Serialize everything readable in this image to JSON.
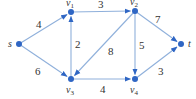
{
  "graph": {
    "nodes": [
      {
        "id": "s",
        "label": "s",
        "sub": "",
        "x": 19,
        "y": 44
      },
      {
        "id": "v1",
        "label": "v",
        "sub": "1",
        "x": 71,
        "y": 12
      },
      {
        "id": "v2",
        "label": "v",
        "sub": "2",
        "x": 135,
        "y": 11
      },
      {
        "id": "v3",
        "label": "v",
        "sub": "3",
        "x": 71,
        "y": 79
      },
      {
        "id": "v4",
        "label": "v",
        "sub": "4",
        "x": 135,
        "y": 79
      },
      {
        "id": "t",
        "label": "t",
        "sub": "",
        "x": 181,
        "y": 44
      }
    ],
    "edges": [
      {
        "from": "s",
        "to": "v1",
        "weight": "4"
      },
      {
        "from": "s",
        "to": "v3",
        "weight": "6"
      },
      {
        "from": "v3",
        "to": "v1",
        "weight": "2"
      },
      {
        "from": "v1",
        "to": "v2",
        "weight": "3"
      },
      {
        "from": "v2",
        "to": "v3",
        "weight": "8"
      },
      {
        "from": "v2",
        "to": "v4",
        "weight": "5"
      },
      {
        "from": "v3",
        "to": "v4",
        "weight": "4"
      },
      {
        "from": "v2",
        "to": "t",
        "weight": "7"
      },
      {
        "from": "v4",
        "to": "t",
        "weight": "3"
      }
    ]
  },
  "colors": {
    "edge": "#8fb0db",
    "node": "#2f66c4",
    "text": "#333333"
  }
}
